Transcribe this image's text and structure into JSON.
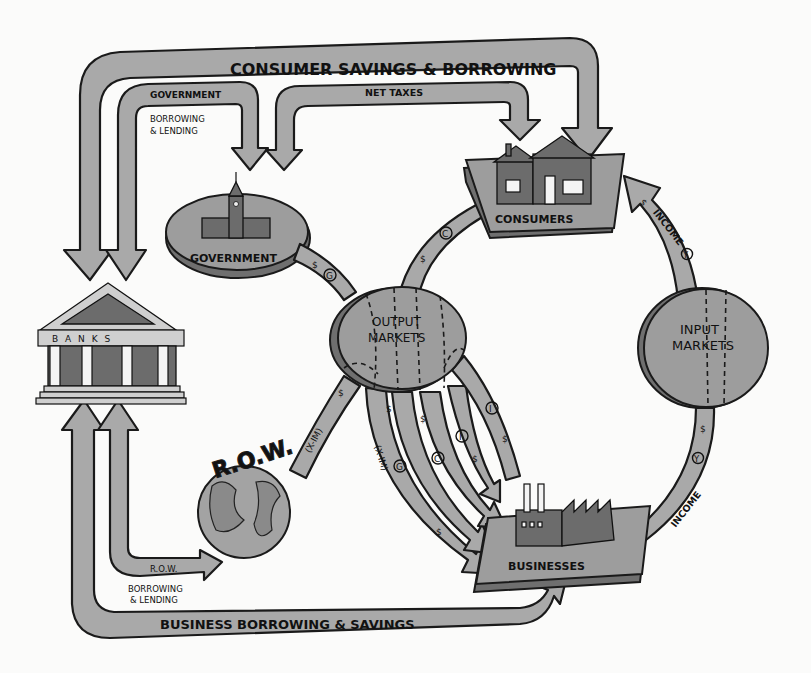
{
  "diagram": {
    "nodes": {
      "banks": {
        "label": "B A N K S"
      },
      "government": {
        "label": "GOVERNMENT"
      },
      "consumers": {
        "label": "CONSUMERS"
      },
      "output_markets": {
        "label_line1": "OUTPUT",
        "label_line2": "MARKETS"
      },
      "input_markets": {
        "label_line1": "INPUT",
        "label_line2": "MARKETS"
      },
      "businesses": {
        "label": "BUSINESSES"
      },
      "row": {
        "label": "R.O.W."
      }
    },
    "flows": {
      "consumer_savings": {
        "label": "CONSUMER SAVINGS & BORROWING"
      },
      "gov_borrowing": {
        "label_line1": "GOVERNMENT",
        "label_line2": "BORROWING",
        "label_line3": "& LENDING"
      },
      "net_taxes": {
        "label": "NET TAXES"
      },
      "row_borrowing": {
        "label_line1": "R.O.W.",
        "label_line2": "BORROWING",
        "label_line3": "& LENDING"
      },
      "business_borrowing": {
        "label": "BUSINESS BORROWING & SAVINGS"
      },
      "consumption": {
        "symbol": "C",
        "currency": "$"
      },
      "gov_spending": {
        "symbol": "G",
        "currency": "$"
      },
      "net_exports_row": {
        "symbol": "(X-IM)",
        "currency": "$"
      },
      "income_to_consumers": {
        "label": "INCOME",
        "symbol": "Y",
        "currency": "$"
      },
      "income_from_business": {
        "label": "INCOME",
        "symbol": "Y",
        "currency": "$"
      },
      "output_to_business": [
        {
          "symbol": "(X-IM)",
          "currency": "$"
        },
        {
          "symbol": "G",
          "currency": "$"
        },
        {
          "symbol": "C",
          "currency": "$"
        },
        {
          "symbol": "I",
          "currency": "$"
        },
        {
          "symbol": "I",
          "currency": "$"
        }
      ]
    },
    "colors": {
      "arrow_fill": "#a9a9a9",
      "outline": "#1a1a1a",
      "background": "#fbfbfa"
    }
  }
}
